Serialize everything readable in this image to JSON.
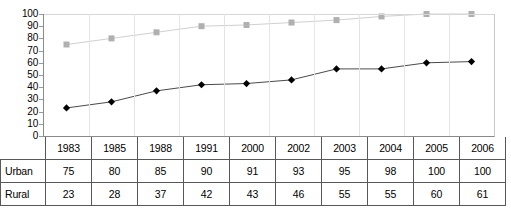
{
  "chart_data": {
    "type": "line",
    "title": "",
    "xlabel": "",
    "ylabel": "",
    "categories": [
      "1983",
      "1985",
      "1988",
      "1991",
      "2000",
      "2002",
      "2003",
      "2004",
      "2005",
      "2006"
    ],
    "ylim": [
      0,
      100
    ],
    "ytick_step": 10,
    "yticks": [
      "100",
      "90",
      "80",
      "70",
      "60",
      "50",
      "40",
      "30",
      "20",
      "10",
      "0"
    ],
    "grid": "horizontal-top-only",
    "legend": "none",
    "series": [
      {
        "name": "Urban",
        "marker": "square",
        "color": "#b0b0b0",
        "line_color": "#d0d0d0",
        "values": [
          75,
          80,
          85,
          90,
          91,
          93,
          95,
          98,
          100,
          100
        ]
      },
      {
        "name": "Rural",
        "marker": "diamond",
        "color": "#000000",
        "line_color": "#4a4a4a",
        "values": [
          23,
          28,
          37,
          42,
          43,
          46,
          55,
          55,
          60,
          61
        ]
      }
    ]
  },
  "table": {
    "corner_label": "",
    "years_header": [
      "1983",
      "1985",
      "1988",
      "1991",
      "2000",
      "2002",
      "2003",
      "2004",
      "2005",
      "2006"
    ],
    "rows": [
      {
        "label": "Urban",
        "values": [
          "75",
          "80",
          "85",
          "90",
          "91",
          "93",
          "95",
          "98",
          "100",
          "100"
        ]
      },
      {
        "label": "Rural",
        "values": [
          "23",
          "28",
          "37",
          "42",
          "43",
          "46",
          "55",
          "55",
          "60",
          "61"
        ]
      }
    ]
  }
}
